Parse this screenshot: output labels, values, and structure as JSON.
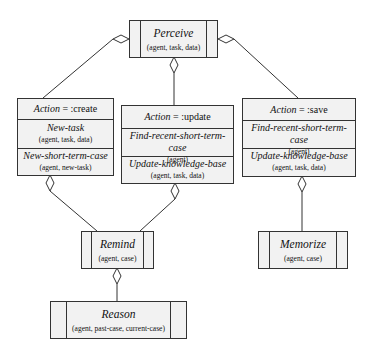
{
  "diagram": {
    "perceive": {
      "title": "Perceive",
      "args": "(agent, task, data)"
    },
    "create": {
      "header_keyword": "Action",
      "header_value": " = :create",
      "ops": [
        {
          "name": "New-task",
          "args": "(agent, task, data)"
        },
        {
          "name": "New-short-term-case",
          "args": "(agent, new-task)"
        }
      ]
    },
    "update": {
      "header_keyword": "Action",
      "header_value": " = :update",
      "ops": [
        {
          "name": "Find-recent-short-term-case",
          "args": "(agent)"
        },
        {
          "name": "Update-knowledge-base",
          "args": "(agent, task, data)"
        }
      ]
    },
    "save": {
      "header_keyword": "Action",
      "header_value": " = :save",
      "ops": [
        {
          "name": "Find-recent-short-term-case",
          "args": "(agent)"
        },
        {
          "name": "Update-knowledge-base",
          "args": "(agent, task, data)"
        }
      ]
    },
    "remind": {
      "title": "Remind",
      "args": "(agent, case)"
    },
    "memorize": {
      "title": "Memorize",
      "args": "(agent, case)"
    },
    "reason": {
      "title": "Reason",
      "args": "(agent, past-case, current-case)"
    },
    "colors": {
      "line": "#333333",
      "box_fill": "#f2f2f2",
      "diamond_fill": "#ffffff"
    }
  }
}
